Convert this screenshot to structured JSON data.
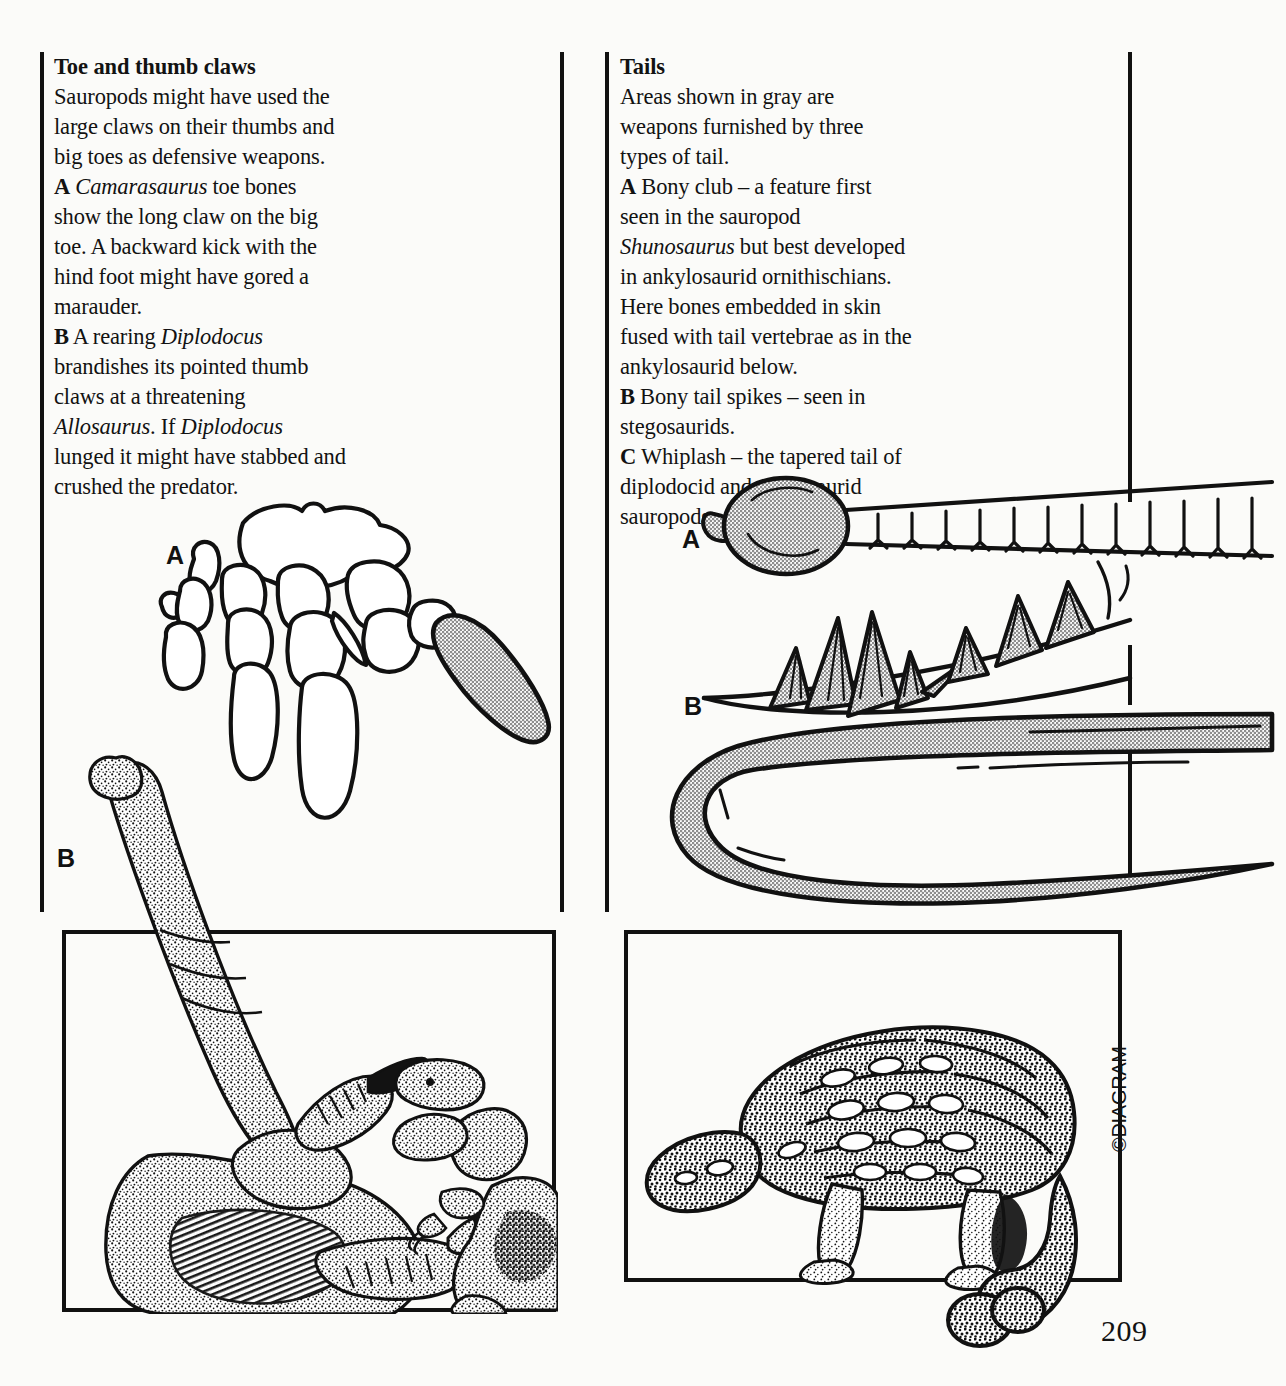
{
  "page": {
    "number": "209",
    "copyright": "©DIAGRAM",
    "paper_color": "#fbfbf9",
    "ink_color": "#121212",
    "gray_fill": "#a9a9a9"
  },
  "left_column": {
    "heading": "Toe and thumb claws",
    "intro": "Sauropods might have used the large claws on their thumbs and big toes as defensive weapons.",
    "entries": [
      {
        "label": "A",
        "text_parts": [
          {
            "text": "Camarasaurus",
            "italic": true
          },
          {
            "text": " toe bones show the long claw on the big toe. A backward kick with the hind foot might have gored a marauder.",
            "italic": false
          }
        ]
      },
      {
        "label": "B",
        "text_parts": [
          {
            "text": "A rearing ",
            "italic": false
          },
          {
            "text": "Diplodocus",
            "italic": true
          },
          {
            "text": " brandishes its pointed thumb claws at a threatening ",
            "italic": false
          },
          {
            "text": "Allosaurus",
            "italic": true
          },
          {
            "text": ". If ",
            "italic": false
          },
          {
            "text": "Diplodocus",
            "italic": true
          },
          {
            "text": " lunged it might have stabbed and crushed the predator.",
            "italic": false
          }
        ]
      }
    ]
  },
  "right_column": {
    "heading": "Tails",
    "intro": "Areas shown in gray are weapons furnished by three types of tail.",
    "entries": [
      {
        "label": "A",
        "text_parts": [
          {
            "text": "Bony club – a feature first seen in the sauropod ",
            "italic": false
          },
          {
            "text": "Shunosaurus",
            "italic": true
          },
          {
            "text": " but best developed in ankylosaurid ornithischians. Here bones embedded in skin fused with tail vertebrae as in the ankylosaurid below.",
            "italic": false
          }
        ]
      },
      {
        "label": "B",
        "text_parts": [
          {
            "text": "Bony tail spikes – seen in stegosaurids.",
            "italic": false
          }
        ]
      },
      {
        "label": "C",
        "text_parts": [
          {
            "text": "Whiplash – the tapered tail of diplodocid and titanosaurid sauropods.",
            "italic": false
          }
        ]
      }
    ]
  },
  "figures": {
    "toe_bones": {
      "label": "A",
      "caption_ref": "Camarasaurus toe bones with gray claw on big toe"
    },
    "diplodocus_scene": {
      "label": "B",
      "caption_ref": "Rearing Diplodocus facing Allosaurus"
    },
    "tail_club": {
      "label": "A",
      "caption_ref": "Bony club tail with vertebrae"
    },
    "tail_spikes": {
      "label": "B",
      "caption_ref": "Bony tail spikes of stegosaurid"
    },
    "tail_whiplash": {
      "label": "C",
      "caption_ref": "Whiplash tapered tail"
    },
    "ankylosaur_scene": {
      "label": "",
      "caption_ref": "Armoured ankylosaurid with clubbed tail"
    }
  }
}
